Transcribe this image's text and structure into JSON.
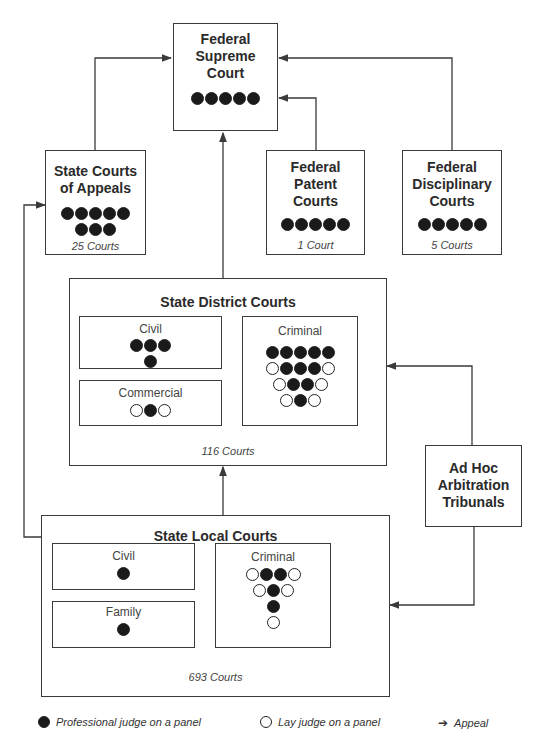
{
  "supreme": {
    "title_lines": [
      "Federal",
      "Supreme",
      "Court"
    ],
    "panel": [
      "P",
      "P",
      "P",
      "P",
      "P"
    ]
  },
  "appeals": {
    "title_lines": [
      "State Courts",
      "of Appeals"
    ],
    "panel_rows": [
      [
        "P",
        "P",
        "P",
        "P",
        "P"
      ],
      [
        "P",
        "P",
        "P"
      ]
    ],
    "count": "25 Courts"
  },
  "patent": {
    "title_lines": [
      "Federal",
      "Patent",
      "Courts"
    ],
    "panel": [
      "P",
      "P",
      "P",
      "P",
      "P"
    ],
    "count": "1 Court"
  },
  "disciplinary": {
    "title_lines": [
      "Federal",
      "Disciplinary",
      "Courts"
    ],
    "panel": [
      "P",
      "P",
      "P",
      "P",
      "P"
    ],
    "count": "5 Courts"
  },
  "district": {
    "title": "State District Courts",
    "count": "116 Courts",
    "civil": {
      "label": "Civil",
      "panel_rows": [
        [
          "P",
          "P",
          "P"
        ],
        [
          "P"
        ]
      ]
    },
    "commercial": {
      "label": "Commercial",
      "panel_rows": [
        [
          "L",
          "P",
          "L"
        ]
      ]
    },
    "criminal": {
      "label": "Criminal",
      "panel_rows": [
        [
          "P",
          "P",
          "P",
          "P",
          "P"
        ],
        [
          "L",
          "P",
          "P",
          "P",
          "L"
        ],
        [
          "L",
          "P",
          "P",
          "L"
        ],
        [
          "L",
          "P",
          "L"
        ]
      ]
    }
  },
  "arbitration": {
    "title_lines": [
      "Ad Hoc",
      "Arbitration",
      "Tribunals"
    ]
  },
  "local": {
    "title": "State Local Courts",
    "count": "693 Courts",
    "civil": {
      "label": "Civil",
      "panel_rows": [
        [
          "P"
        ]
      ]
    },
    "family": {
      "label": "Family",
      "panel_rows": [
        [
          "P"
        ]
      ]
    },
    "criminal": {
      "label": "Criminal",
      "panel_rows": [
        [
          "L",
          "P",
          "P",
          "L"
        ],
        [
          "L",
          "P",
          "L"
        ],
        [
          "P"
        ],
        [
          "L"
        ]
      ]
    }
  },
  "legend": {
    "professional": "Professional judge on a panel",
    "lay": "Lay judge on a panel",
    "appeal": "Appeal"
  },
  "colors": {
    "line": "#3a3a3a",
    "professional_fill": "#1a1a1a",
    "lay_fill": "#ffffff"
  }
}
